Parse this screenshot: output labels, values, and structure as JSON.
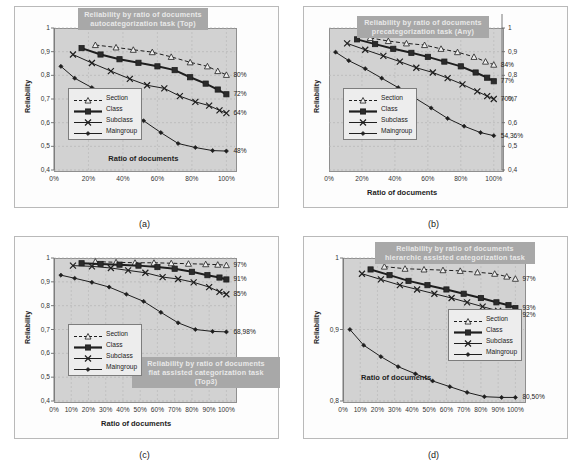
{
  "figure": {
    "panels": [
      {
        "caption": "(a)",
        "title": "Reliability by ratio of documents\nautocategorization task (Top)",
        "chart_data": {
          "type": "line",
          "title": "Reliability by ratio of documents autocategorization task (Top)",
          "xlabel": "Ratio of documents",
          "ylabel": "Reliability",
          "xlim": [
            0,
            105
          ],
          "ylim": [
            0.4,
            1.0
          ],
          "yticks": [
            "0,4",
            "0,5",
            "0,6",
            "0,7",
            "0,8",
            "0,9",
            "1"
          ],
          "ytickvals": [
            0.4,
            0.5,
            0.6,
            0.7,
            0.8,
            0.9,
            1.0
          ],
          "xticks": [
            "0%",
            "20%",
            "40%",
            "60%",
            "80%",
            "100%"
          ],
          "xtickvals": [
            0,
            20,
            40,
            60,
            80,
            100
          ],
          "grid": true,
          "legend_position": "left-middle",
          "legend": [
            "Section",
            "Class",
            "Subclass",
            "Maingroup"
          ],
          "axis_side": "left",
          "series": [
            {
              "name": "Section",
              "end_label": "80%",
              "x": [
                24,
                36,
                46,
                57,
                68,
                79,
                89,
                95,
                100
              ],
              "y": [
                0.928,
                0.918,
                0.908,
                0.898,
                0.878,
                0.855,
                0.838,
                0.818,
                0.802
              ]
            },
            {
              "name": "Class",
              "end_label": "72%",
              "x": [
                16,
                27,
                38,
                49,
                60,
                70,
                79,
                88,
                95,
                100
              ],
              "y": [
                0.915,
                0.888,
                0.868,
                0.853,
                0.838,
                0.822,
                0.792,
                0.765,
                0.74,
                0.72
              ]
            },
            {
              "name": "Subclass",
              "end_label": "64%",
              "x": [
                11,
                22,
                33,
                44,
                54,
                64,
                73,
                82,
                90,
                96,
                100
              ],
              "y": [
                0.888,
                0.852,
                0.818,
                0.785,
                0.758,
                0.745,
                0.712,
                0.688,
                0.672,
                0.652,
                0.64
              ]
            },
            {
              "name": "Maingroup",
              "end_label": "48%",
              "x": [
                4,
                12,
                22,
                32,
                42,
                52,
                62,
                72,
                82,
                92,
                100
              ],
              "y": [
                0.838,
                0.788,
                0.748,
                0.705,
                0.658,
                0.608,
                0.558,
                0.512,
                0.495,
                0.482,
                0.48
              ]
            }
          ]
        }
      },
      {
        "caption": "(b)",
        "title": "Reliability by ratio of documents\nprecategorization task (Any)",
        "chart_data": {
          "type": "line",
          "title": "Reliability by ratio of documents precategorization task (Any)",
          "xlabel": "Ratio of documents",
          "ylabel": "Reliability",
          "xlim": [
            0,
            105
          ],
          "ylim": [
            0.4,
            1.0
          ],
          "yticks": [
            "0,4",
            "0,5",
            "0,6",
            "0,7",
            "0,8",
            "0,9",
            "1"
          ],
          "ytickvals": [
            0.4,
            0.5,
            0.6,
            0.7,
            0.8,
            0.9,
            1.0
          ],
          "xticks": [
            "0%",
            "20%",
            "40%",
            "60%",
            "80%",
            "100%"
          ],
          "xtickvals": [
            0,
            20,
            40,
            60,
            80,
            100
          ],
          "grid": true,
          "legend_position": "left-middle",
          "legend": [
            "Section",
            "Class",
            "Subclass",
            "Maingroup"
          ],
          "axis_side": "right",
          "series": [
            {
              "name": "Section",
              "end_label": "84%",
              "x": [
                25,
                36,
                47,
                58,
                68,
                78,
                88,
                95,
                100
              ],
              "y": [
                0.958,
                0.945,
                0.935,
                0.928,
                0.912,
                0.898,
                0.878,
                0.858,
                0.845
              ]
            },
            {
              "name": "Class",
              "end_label": "77%",
              "x": [
                17,
                28,
                39,
                50,
                60,
                70,
                80,
                89,
                96,
                100
              ],
              "y": [
                0.952,
                0.932,
                0.912,
                0.895,
                0.878,
                0.858,
                0.838,
                0.812,
                0.79,
                0.775
              ]
            },
            {
              "name": "Subclass",
              "end_label": "70%",
              "x": [
                11,
                22,
                33,
                43,
                53,
                63,
                72,
                81,
                90,
                96,
                100
              ],
              "y": [
                0.935,
                0.908,
                0.882,
                0.858,
                0.832,
                0.812,
                0.788,
                0.762,
                0.732,
                0.712,
                0.7
              ]
            },
            {
              "name": "Maingroup",
              "end_label": "54,36%",
              "x": [
                4,
                12,
                22,
                32,
                42,
                52,
                62,
                72,
                82,
                92,
                100
              ],
              "y": [
                0.898,
                0.862,
                0.828,
                0.788,
                0.748,
                0.705,
                0.662,
                0.618,
                0.585,
                0.558,
                0.545
              ]
            }
          ]
        }
      },
      {
        "caption": "(c)",
        "title": "Reliability by ratio of documents\nflat assisted categorization task (Top3)",
        "chart_data": {
          "type": "line",
          "title": "Reliability by ratio of documents flat assisted categorization task (Top3)",
          "xlabel": "Ratio of documents",
          "ylabel": "Reliability",
          "xlim": [
            0,
            105
          ],
          "ylim": [
            0.4,
            1.0
          ],
          "yticks": [
            "0,4",
            "0,5",
            "0,6",
            "0,7",
            "0,8",
            "0,9",
            "1"
          ],
          "ytickvals": [
            0.4,
            0.5,
            0.6,
            0.7,
            0.8,
            0.9,
            1.0
          ],
          "xticks": [
            "0%",
            "10%",
            "20%",
            "30%",
            "40%",
            "50%",
            "60%",
            "70%",
            "80%",
            "90%",
            "100%"
          ],
          "xtickvals": [
            0,
            10,
            20,
            30,
            40,
            50,
            60,
            70,
            80,
            90,
            100
          ],
          "grid": true,
          "legend_position": "left-lower",
          "legend": [
            "Section",
            "Class",
            "Subclass",
            "Maingroup"
          ],
          "axis_side": "left",
          "series": [
            {
              "name": "Section",
              "end_label": "97%",
              "x": [
                24,
                36,
                47,
                58,
                68,
                78,
                88,
                95,
                100
              ],
              "y": [
                0.985,
                0.982,
                0.98,
                0.98,
                0.978,
                0.976,
                0.974,
                0.972,
                0.97
              ]
            },
            {
              "name": "Class",
              "end_label": "91%",
              "x": [
                16,
                27,
                38,
                49,
                60,
                70,
                80,
                89,
                96,
                100
              ],
              "y": [
                0.978,
                0.975,
                0.972,
                0.968,
                0.962,
                0.955,
                0.942,
                0.928,
                0.918,
                0.91
              ]
            },
            {
              "name": "Subclass",
              "end_label": "85%",
              "x": [
                11,
                22,
                33,
                43,
                53,
                63,
                72,
                81,
                90,
                96,
                100
              ],
              "y": [
                0.968,
                0.965,
                0.958,
                0.948,
                0.938,
                0.92,
                0.912,
                0.898,
                0.878,
                0.858,
                0.848
              ]
            },
            {
              "name": "Maingroup",
              "end_label": "68,98%",
              "x": [
                4,
                12,
                22,
                32,
                42,
                52,
                62,
                72,
                82,
                92,
                100
              ],
              "y": [
                0.928,
                0.915,
                0.898,
                0.878,
                0.848,
                0.818,
                0.772,
                0.728,
                0.7,
                0.692,
                0.69
              ]
            }
          ]
        }
      },
      {
        "caption": "(d)",
        "title": "Reliability by ratio of documents\nhierarchic assisted categorization task",
        "chart_data": {
          "type": "line",
          "title": "Reliability by ratio of documents hierarchic assisted categorization task",
          "xlabel": "Ratio of documents",
          "ylabel": "Reliability",
          "xlim": [
            0,
            105
          ],
          "ylim": [
            0.8,
            1.0
          ],
          "yticks": [
            "0,8",
            "0,9",
            "1"
          ],
          "ytickvals": [
            0.8,
            0.9,
            1.0
          ],
          "xticks": [
            "0%",
            "10%",
            "20%",
            "30%",
            "40%",
            "50%",
            "60%",
            "70%",
            "80%",
            "90%",
            "100%"
          ],
          "xtickvals": [
            0,
            10,
            20,
            30,
            40,
            50,
            60,
            70,
            80,
            90,
            100
          ],
          "grid": true,
          "legend_position": "right-middle",
          "legend": [
            "Section",
            "Class",
            "Subclass",
            "Maingroup"
          ],
          "axis_side": "left",
          "series": [
            {
              "name": "Section",
              "end_label": "97%",
              "x": [
                24,
                36,
                47,
                58,
                68,
                78,
                88,
                95,
                100
              ],
              "y": [
                0.988,
                0.985,
                0.984,
                0.983,
                0.982,
                0.98,
                0.978,
                0.974,
                0.971
              ]
            },
            {
              "name": "Class",
              "end_label": "93%",
              "x": [
                16,
                27,
                38,
                49,
                60,
                70,
                80,
                89,
                96,
                100
              ],
              "y": [
                0.984,
                0.976,
                0.968,
                0.962,
                0.956,
                0.95,
                0.944,
                0.938,
                0.934,
                0.93
              ]
            },
            {
              "name": "Subclass",
              "end_label": "92%",
              "x": [
                11,
                22,
                33,
                43,
                53,
                63,
                72,
                81,
                90,
                96,
                100
              ],
              "y": [
                0.978,
                0.97,
                0.962,
                0.956,
                0.95,
                0.944,
                0.938,
                0.932,
                0.926,
                0.922,
                0.92
              ]
            },
            {
              "name": "Maingroup",
              "end_label": "80,50%",
              "x": [
                4,
                12,
                22,
                32,
                42,
                52,
                62,
                72,
                82,
                92,
                100
              ],
              "y": [
                0.9,
                0.878,
                0.862,
                0.848,
                0.838,
                0.828,
                0.82,
                0.812,
                0.806,
                0.805,
                0.805
              ]
            }
          ]
        }
      }
    ]
  },
  "style": {
    "plot_bg": "#d2d2d2",
    "title_bg": "#a8a8a8",
    "title_fg": "#e8e8e8",
    "line_color": "#2b2b2b"
  }
}
